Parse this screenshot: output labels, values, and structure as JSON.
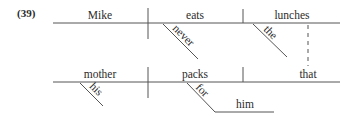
{
  "example_label": "(39)",
  "clause1": {
    "subject": "Mike",
    "verb": "eats",
    "object": "lunches",
    "modifiers": {
      "verb_adverb": "never",
      "object_determiner": "the"
    }
  },
  "clause2": {
    "subject": "mother",
    "verb": "packs",
    "object": "that",
    "modifiers": {
      "subject_determiner": "his",
      "preposition": "for",
      "prep_object": "him"
    }
  },
  "connector": {
    "type": "dashed-relative-link",
    "from": "lunches",
    "to": "that"
  }
}
